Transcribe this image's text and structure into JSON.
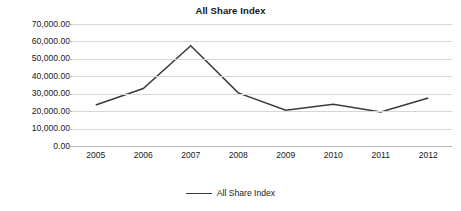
{
  "chart_data": {
    "type": "line",
    "title": "All Share Index",
    "xlabel": "",
    "ylabel": "",
    "categories": [
      "2005",
      "2006",
      "2007",
      "2008",
      "2009",
      "2010",
      "2011",
      "2012"
    ],
    "series": [
      {
        "name": "All Share Index",
        "values": [
          23500,
          33000,
          57500,
          30500,
          20500,
          24000,
          19500,
          27500
        ],
        "color": "#3a3a3a"
      }
    ],
    "ylim": [
      0,
      70000
    ],
    "yticks": [
      0,
      10000,
      20000,
      30000,
      40000,
      50000,
      60000,
      70000
    ],
    "ytick_labels": [
      "0.00",
      "10,000.00",
      "20,000.00",
      "30,000.00",
      "40,000.00",
      "50,000.00",
      "60,000.00",
      "70,000.00"
    ],
    "grid": true,
    "legend_position": "bottom",
    "legend_entries": [
      "All Share Index"
    ]
  }
}
